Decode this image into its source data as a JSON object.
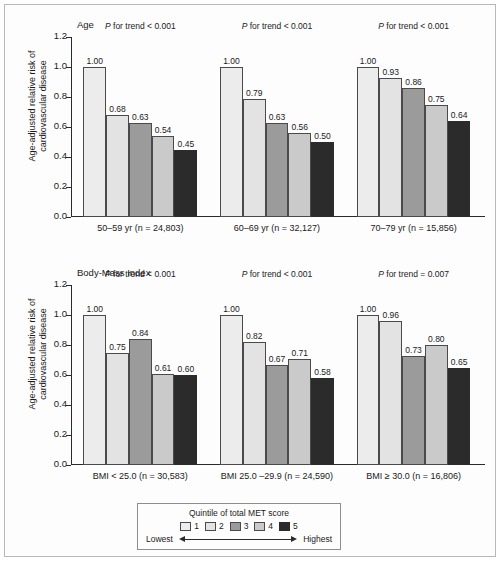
{
  "figure": {
    "y_axis_label_line1": "Age-adjusted relative risk of",
    "y_axis_label_line2": "cardiovascular disease"
  },
  "legend": {
    "title": "Quintile of total MET score",
    "items": [
      {
        "label": "1",
        "color": "#ececec"
      },
      {
        "label": "2",
        "color": "#e3e3e3"
      },
      {
        "label": "3",
        "color": "#9b9b9b"
      },
      {
        "label": "4",
        "color": "#cacaca"
      },
      {
        "label": "5",
        "color": "#2b2b2b"
      }
    ],
    "low_label": "Lowest",
    "high_label": "Highest"
  },
  "chart_data": [
    {
      "type": "bar",
      "title": "Age",
      "ylabel": "Age-adjusted relative risk of cardiovascular disease",
      "xlabel": "",
      "ylim": [
        0.0,
        1.2
      ],
      "yticks": [
        "0.0",
        "0.2",
        "0.4",
        "0.6",
        "0.8",
        "1.0",
        "1.2"
      ],
      "grid": false,
      "legend_position": "bottom-outside",
      "series_names": [
        "1",
        "2",
        "3",
        "4",
        "5"
      ],
      "groups": [
        {
          "category": "50–59 yr (n = 24,803)",
          "annotation": "P for trend < 0.001",
          "annotation_prefix": "P",
          "annotation_rest": "for trend < 0.001",
          "values": [
            1.0,
            0.68,
            0.63,
            0.54,
            0.45
          ],
          "labels": [
            "1.00",
            "0.68",
            "0.63",
            "0.54",
            "0.45"
          ]
        },
        {
          "category": "60–69 yr (n = 32,127)",
          "annotation": "P for trend < 0.001",
          "annotation_prefix": "P",
          "annotation_rest": "for trend < 0.001",
          "values": [
            1.0,
            0.79,
            0.63,
            0.56,
            0.5
          ],
          "labels": [
            "1.00",
            "0.79",
            "0.63",
            "0.56",
            "0.50"
          ]
        },
        {
          "category": "70–79 yr (n = 15,856)",
          "annotation": "P for trend < 0.001",
          "annotation_prefix": "P",
          "annotation_rest": "for trend < 0.001",
          "values": [
            1.0,
            0.93,
            0.86,
            0.75,
            0.64
          ],
          "labels": [
            "1.00",
            "0.93",
            "0.86",
            "0.75",
            "0.64"
          ]
        }
      ]
    },
    {
      "type": "bar",
      "title": "Body-Mass Index",
      "ylabel": "Age-adjusted relative risk of cardiovascular disease",
      "xlabel": "",
      "ylim": [
        0.0,
        1.2
      ],
      "yticks": [
        "0.0",
        "0.2",
        "0.4",
        "0.6",
        "0.8",
        "1.0",
        "1.2"
      ],
      "grid": false,
      "legend_position": "bottom-outside",
      "series_names": [
        "1",
        "2",
        "3",
        "4",
        "5"
      ],
      "groups": [
        {
          "category": "BMI < 25.0 (n = 30,583)",
          "annotation": "P for trend < 0.001",
          "annotation_prefix": "P",
          "annotation_rest": "for trend < 0.001",
          "values": [
            1.0,
            0.75,
            0.84,
            0.61,
            0.6
          ],
          "labels": [
            "1.00",
            "0.75",
            "0.84",
            "0.61",
            "0.60"
          ]
        },
        {
          "category": "BMI 25.0 –29.9 (n = 24,590)",
          "annotation": "P for trend < 0.001",
          "annotation_prefix": "P",
          "annotation_rest": "for trend < 0.001",
          "values": [
            1.0,
            0.82,
            0.67,
            0.71,
            0.58
          ],
          "labels": [
            "1.00",
            "0.82",
            "0.67",
            "0.71",
            "0.58"
          ]
        },
        {
          "category": "BMI ≥ 30.0 (n = 16,806)",
          "annotation": "P for trend = 0.007",
          "annotation_prefix": "P",
          "annotation_rest": "for trend = 0.007",
          "values": [
            1.0,
            0.96,
            0.73,
            0.8,
            0.65
          ],
          "labels": [
            "1.00",
            "0.96",
            "0.73",
            "0.80",
            "0.65"
          ]
        }
      ]
    }
  ]
}
